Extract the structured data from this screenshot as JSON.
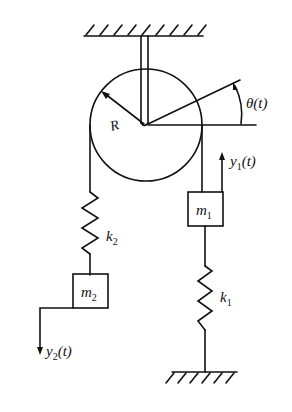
{
  "diagram": {
    "type": "mechanical-system",
    "labels": {
      "radius": "R",
      "angle": "θ(t)",
      "k1": {
        "base": "k",
        "sub": "1"
      },
      "k2": {
        "base": "k",
        "sub": "2"
      },
      "m1": {
        "base": "m",
        "sub": "1"
      },
      "m2": {
        "base": "m",
        "sub": "2"
      },
      "y1": {
        "base": "y",
        "sub": "1",
        "suffix": "(t)"
      },
      "y2": {
        "base": "y",
        "sub": "2",
        "suffix": "(t)"
      }
    },
    "colors": {
      "stroke": "#111111",
      "background": "#ffffff"
    }
  }
}
